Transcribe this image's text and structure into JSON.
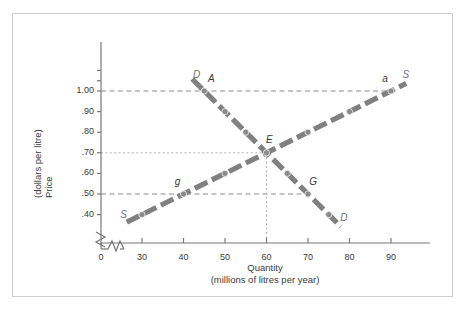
{
  "figure": {
    "background": "#ffffff",
    "border_color": "#cfcfcf",
    "curve_color": "#808080",
    "text_color": "#3a3a3a",
    "label_color": "#6e6e6e"
  },
  "chart_data": {
    "type": "line",
    "title": "",
    "xlabel": "Quantity",
    "xlabel_sub": "(millions of litres per year)",
    "ylabel": "Price",
    "ylabel_sub": "(dollars per litre)",
    "xlim": [
      20,
      96
    ],
    "ylim": [
      0.34,
      1.12
    ],
    "grid": false,
    "axis_break_x": true,
    "axis_break_y": true,
    "xticks": [
      {
        "value": 0,
        "label": "0"
      },
      {
        "value": 30,
        "label": "30"
      },
      {
        "value": 40,
        "label": "40"
      },
      {
        "value": 50,
        "label": "50"
      },
      {
        "value": 60,
        "label": "60"
      },
      {
        "value": 70,
        "label": "70"
      },
      {
        "value": 80,
        "label": "80"
      },
      {
        "value": 90,
        "label": "90"
      }
    ],
    "yticks": [
      {
        "value": 1.0,
        "label": "1.00"
      },
      {
        "value": 0.9,
        "label": ".90"
      },
      {
        "value": 0.8,
        "label": ".80"
      },
      {
        "value": 0.7,
        "label": ".70"
      },
      {
        "value": 0.6,
        "label": ".60"
      },
      {
        "value": 0.5,
        "label": ".50"
      },
      {
        "value": 0.4,
        "label": ".40"
      }
    ],
    "series": [
      {
        "name": "Demand",
        "curve_label": "D",
        "color": "#808080",
        "x": [
          45,
          50,
          55,
          60,
          65,
          70,
          75
        ],
        "y": [
          1.0,
          0.9,
          0.8,
          0.7,
          0.6,
          0.5,
          0.4
        ]
      },
      {
        "name": "Supply",
        "curve_label": "S",
        "color": "#808080",
        "x": [
          30,
          40,
          50,
          60,
          70,
          80,
          90
        ],
        "y": [
          0.4,
          0.5,
          0.6,
          0.7,
          0.8,
          0.9,
          1.0
        ]
      }
    ],
    "annotations": [
      {
        "text": "D",
        "x": 43.0,
        "y": 1.075,
        "kind": "curve-end",
        "series": "Demand"
      },
      {
        "text": "D",
        "x": 78.5,
        "y": 0.378,
        "kind": "curve-end",
        "series": "Demand"
      },
      {
        "text": "S",
        "x": 25.5,
        "y": 0.392,
        "kind": "curve-end",
        "series": "Supply"
      },
      {
        "text": "S",
        "x": 93.5,
        "y": 1.075,
        "kind": "curve-end",
        "series": "Supply"
      },
      {
        "text": "A",
        "x": 46.6,
        "y": 1.055,
        "kind": "point",
        "series": "Demand"
      },
      {
        "text": "a",
        "x": 88.6,
        "y": 1.055,
        "kind": "point",
        "series": "Supply"
      },
      {
        "text": "E",
        "x": 60.6,
        "y": 0.755,
        "kind": "point",
        "series": "Equilibrium"
      },
      {
        "text": "g",
        "x": 38.6,
        "y": 0.552,
        "kind": "point",
        "series": "Supply"
      },
      {
        "text": "G",
        "x": 71.0,
        "y": 0.552,
        "kind": "point",
        "series": "Demand"
      }
    ],
    "reference_lines": [
      {
        "orientation": "horizontal",
        "value": 1.0,
        "from_x": 20.0,
        "to_x": 90.0,
        "style": "dashed"
      },
      {
        "orientation": "horizontal",
        "value": 0.7,
        "from_x": 20.0,
        "to_x": 60.0,
        "style": "dotted"
      },
      {
        "orientation": "horizontal",
        "value": 0.5,
        "from_x": 20.0,
        "to_x": 70.0,
        "style": "dashed"
      },
      {
        "orientation": "vertical",
        "value": 60,
        "from_y": 0.345,
        "to_y": 0.7,
        "style": "dotted"
      }
    ],
    "key_points": [
      {
        "label": "A",
        "quantity": 45,
        "price": 1.0,
        "curve": "Demand"
      },
      {
        "label": "a",
        "quantity": 90,
        "price": 1.0,
        "curve": "Supply"
      },
      {
        "label": "E",
        "quantity": 60,
        "price": 0.7,
        "curve": "Equilibrium"
      },
      {
        "label": "g",
        "quantity": 40,
        "price": 0.5,
        "curve": "Supply"
      },
      {
        "label": "G",
        "quantity": 70,
        "price": 0.5,
        "curve": "Demand"
      }
    ]
  }
}
